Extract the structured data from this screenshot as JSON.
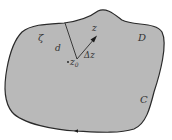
{
  "diagram": {
    "region_label": "D",
    "contour_label": "C",
    "boundary_point_label": "ζ",
    "distance_label": "d",
    "point_label": "z",
    "center_label": "z",
    "center_subscript": "0",
    "increment_label": "Δz",
    "colors": {
      "fill": "#b9b9b9",
      "stroke": "#2a2a2a",
      "text": "#333333",
      "background": "#ffffff"
    }
  }
}
